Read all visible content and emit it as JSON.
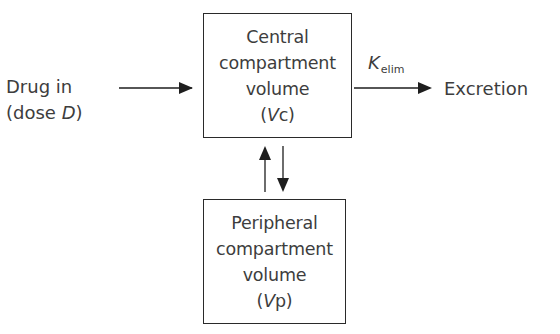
{
  "diagram": {
    "input": {
      "line1": "Drug in",
      "line2_prefix": "(dose ",
      "line2_var": "D",
      "line2_suffix": ")"
    },
    "central_compartment": {
      "line1": "Central",
      "line2": "compartment",
      "line3": "volume",
      "symbol_open": "(",
      "symbol_var": "V",
      "symbol_sub": "c",
      "symbol_close": ")"
    },
    "peripheral_compartment": {
      "line1": "Peripheral",
      "line2": "compartment",
      "line3": "volume",
      "symbol_open": "(",
      "symbol_var": "V",
      "symbol_sub": "p",
      "symbol_close": ")"
    },
    "elimination": {
      "rate_symbol": "K",
      "rate_subscript": "elim"
    },
    "output": {
      "label": "Excretion"
    },
    "edges": [
      {
        "from": "input",
        "to": "central_compartment",
        "direction": "right"
      },
      {
        "from": "central_compartment",
        "to": "output",
        "direction": "right",
        "label": "K_elim"
      },
      {
        "from": "peripheral_compartment",
        "to": "central_compartment",
        "direction": "up"
      },
      {
        "from": "central_compartment",
        "to": "peripheral_compartment",
        "direction": "down"
      }
    ],
    "colors": {
      "stroke": "#1e1e1e",
      "text": "#3d3d3d",
      "background": "#ffffff"
    }
  }
}
